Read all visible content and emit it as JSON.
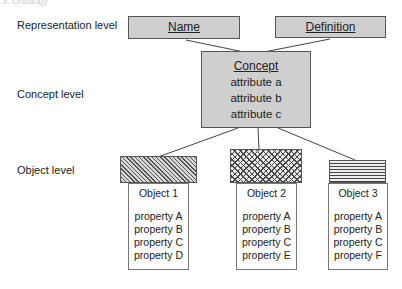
{
  "header": {
    "faded_text": "3.  Ontology"
  },
  "levels": {
    "representation": "Representation level",
    "concept": "Concept level",
    "object": "Object level"
  },
  "representation": {
    "name": "Name",
    "definition": "Definition"
  },
  "concept": {
    "title": "Concept",
    "attributes": [
      "attribute a",
      "attribute b",
      "attribute c"
    ]
  },
  "objects": [
    {
      "title": "Object 1",
      "pattern": "diagonal-hatch",
      "properties": [
        "property A",
        "property B",
        "property C",
        "property D"
      ]
    },
    {
      "title": "Object 2",
      "pattern": "cross-hatch",
      "properties": [
        "property A",
        "property B",
        "property C",
        "property E"
      ]
    },
    {
      "title": "Object 3",
      "pattern": "horizontal-lines",
      "properties": [
        "property A",
        "property B",
        "property C",
        "property F"
      ]
    }
  ],
  "colors": {
    "box_fill": "#cfcfcf",
    "border": "#555555",
    "text": "#222222"
  }
}
